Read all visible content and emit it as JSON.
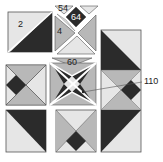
{
  "diagram": {
    "type": "quilt-block-layout",
    "colors": {
      "dark": "#2b2b2b",
      "medium": "#b8b8b8",
      "light": "#e6e6e6",
      "outline": "#555555",
      "background": "#ffffff"
    },
    "labels": {
      "piece_2": "2",
      "piece_4": "4",
      "piece_54": "54",
      "piece_64": "64",
      "piece_60": "60",
      "piece_110": "110"
    }
  }
}
